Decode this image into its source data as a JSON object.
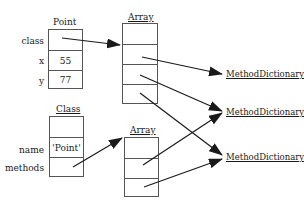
{
  "point_object": {
    "title": "Point",
    "fields": [
      {
        "label": "class",
        "value": ""
      },
      {
        "label": "x",
        "value": "55"
      },
      {
        "label": "y",
        "value": "77"
      }
    ]
  },
  "top_array": {
    "title": "Array",
    "slots": [
      "",
      "",
      "",
      ""
    ]
  },
  "class_object": {
    "title": "Class",
    "fields": [
      {
        "label": "",
        "value": ""
      },
      {
        "label": "name",
        "value": "'Point'"
      },
      {
        "label": "methods",
        "value": ""
      }
    ]
  },
  "bottom_array": {
    "title": "Array",
    "slots": [
      "",
      "",
      ""
    ]
  },
  "method_dictionaries": [
    {
      "label": "MethodDictionary"
    },
    {
      "label": "MethodDictionary"
    },
    {
      "label": "MethodDictionary"
    }
  ],
  "colors": {
    "line": "#1a1a1a",
    "box_border": "#555555",
    "background": "#ffffff"
  }
}
